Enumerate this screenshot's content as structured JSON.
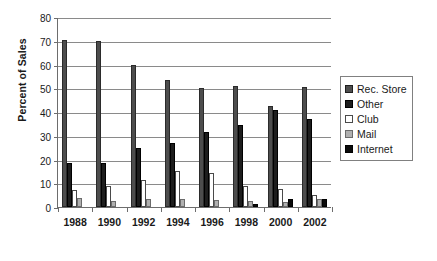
{
  "chart_data": {
    "type": "bar",
    "title": "",
    "xlabel": "",
    "ylabel": "Percent of Sales",
    "categories": [
      "1988",
      "1990",
      "1992",
      "1994",
      "1996",
      "1998",
      "2000",
      "2002"
    ],
    "ylim": [
      0,
      80
    ],
    "yticks": [
      0,
      10,
      20,
      30,
      40,
      50,
      60,
      70,
      80
    ],
    "ytick_labels": [
      "0",
      "10",
      "20",
      "30",
      "40",
      "50",
      "60",
      "70",
      "80"
    ],
    "grid": true,
    "legend_position": "right",
    "series": [
      {
        "name": "Rec. Store",
        "color": "#4d4d4d",
        "values": [
          70.5,
          70.0,
          60.0,
          53.5,
          50.0,
          51.0,
          42.5,
          50.5
        ]
      },
      {
        "name": "Other",
        "color": "#1d1d1d",
        "values": [
          18.5,
          18.5,
          25.0,
          27.0,
          31.5,
          34.5,
          41.0,
          37.0
        ]
      },
      {
        "name": "Club",
        "color": "#ffffff",
        "values": [
          7.0,
          9.0,
          11.5,
          15.0,
          14.3,
          9.0,
          7.5,
          5.0
        ]
      },
      {
        "name": "Mail",
        "color": "#b0b0b0",
        "values": [
          3.7,
          2.5,
          3.3,
          3.3,
          3.0,
          2.5,
          2.3,
          3.2
        ]
      },
      {
        "name": "Internet",
        "color": "#0a0a0a",
        "values": [
          0,
          0,
          0,
          0,
          0,
          1.1,
          3.2,
          3.4
        ]
      }
    ]
  }
}
